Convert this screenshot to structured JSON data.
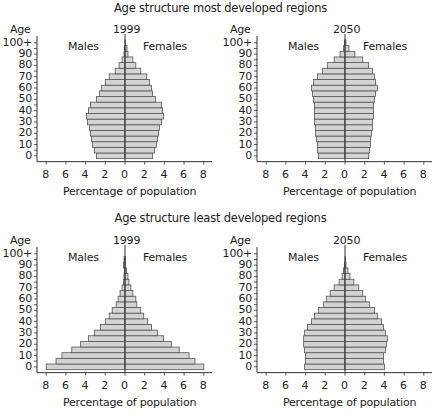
{
  "sections": [
    {
      "title": "Age structure most developed regions"
    },
    {
      "title": "Age structure least developed regions"
    }
  ],
  "common": {
    "y_axis_label": "Age",
    "x_axis_label": "Percentage of population",
    "male_label": "Males",
    "female_label": "Females",
    "y_ticks": [
      "0",
      "10",
      "20",
      "30",
      "40",
      "50",
      "60",
      "70",
      "80",
      "90",
      "100+"
    ],
    "x_ticks": [
      "8",
      "6",
      "4",
      "2",
      "0",
      "2",
      "4",
      "6",
      "8"
    ],
    "bar_fill": "#d3d3d3",
    "bar_stroke": "#555555",
    "axis_color": "#333333"
  },
  "chart_data": [
    {
      "type": "bar",
      "subtype": "population-pyramid",
      "title": "Age structure most developed regions — 1999",
      "year": "1999",
      "xlabel": "Percentage of population",
      "ylabel": "Age",
      "xlim": [
        -8,
        8
      ],
      "age_groups": [
        "0-4",
        "5-9",
        "10-14",
        "15-19",
        "20-24",
        "25-29",
        "30-34",
        "35-39",
        "40-44",
        "45-49",
        "50-54",
        "55-59",
        "60-64",
        "65-69",
        "70-74",
        "75-79",
        "80-84",
        "85-89",
        "90-94",
        "95-99",
        "100+"
      ],
      "series": [
        {
          "name": "Males",
          "values": [
            2.9,
            3.1,
            3.3,
            3.4,
            3.5,
            3.6,
            3.8,
            3.9,
            3.7,
            3.5,
            2.9,
            2.6,
            2.4,
            2.0,
            1.6,
            1.0,
            0.6,
            0.3,
            0.1,
            0.05,
            0.0
          ]
        },
        {
          "name": "Females",
          "values": [
            2.8,
            3.0,
            3.2,
            3.3,
            3.4,
            3.5,
            3.7,
            3.9,
            3.8,
            3.7,
            3.1,
            2.8,
            2.7,
            2.5,
            2.2,
            1.6,
            1.1,
            0.8,
            0.3,
            0.2,
            0.05
          ]
        }
      ]
    },
    {
      "type": "bar",
      "subtype": "population-pyramid",
      "title": "Age structure most developed regions — 2050",
      "year": "2050",
      "xlabel": "Percentage of population",
      "ylabel": "Age",
      "xlim": [
        -8,
        8
      ],
      "age_groups": [
        "0-4",
        "5-9",
        "10-14",
        "15-19",
        "20-24",
        "25-29",
        "30-34",
        "35-39",
        "40-44",
        "45-49",
        "50-54",
        "55-59",
        "60-64",
        "65-69",
        "70-74",
        "75-79",
        "80-84",
        "85-89",
        "90-94",
        "95-99",
        "100+"
      ],
      "series": [
        {
          "name": "Males",
          "values": [
            2.7,
            2.8,
            2.8,
            2.9,
            3.0,
            3.0,
            3.1,
            3.1,
            3.1,
            3.1,
            3.2,
            3.3,
            3.4,
            3.2,
            2.8,
            2.3,
            1.8,
            1.1,
            0.5,
            0.15,
            0.05
          ]
        },
        {
          "name": "Females",
          "values": [
            2.4,
            2.5,
            2.6,
            2.6,
            2.7,
            2.8,
            2.8,
            2.9,
            2.9,
            2.9,
            3.0,
            3.1,
            3.3,
            3.1,
            3.0,
            2.8,
            2.4,
            1.8,
            1.0,
            0.4,
            0.1
          ]
        }
      ]
    },
    {
      "type": "bar",
      "subtype": "population-pyramid",
      "title": "Age structure least developed regions — 1999",
      "year": "1999",
      "xlabel": "Percentage of population",
      "ylabel": "Age",
      "xlim": [
        -8,
        8
      ],
      "age_groups": [
        "0-4",
        "5-9",
        "10-14",
        "15-19",
        "20-24",
        "25-29",
        "30-34",
        "35-39",
        "40-44",
        "45-49",
        "50-54",
        "55-59",
        "60-64",
        "65-69",
        "70-74",
        "75-79",
        "80-84",
        "85-89",
        "90-94",
        "95-99",
        "100+"
      ],
      "series": [
        {
          "name": "Males",
          "values": [
            8.0,
            7.0,
            6.4,
            5.4,
            4.5,
            3.7,
            3.1,
            2.5,
            2.0,
            1.6,
            1.3,
            0.9,
            0.7,
            0.5,
            0.3,
            0.15,
            0.1,
            0.05,
            0.15,
            0.1,
            0.0
          ]
        },
        {
          "name": "Females",
          "values": [
            8.0,
            7.1,
            6.5,
            5.5,
            4.7,
            3.9,
            3.3,
            2.7,
            2.3,
            1.9,
            1.6,
            1.2,
            1.1,
            0.8,
            0.6,
            0.4,
            0.3,
            0.15,
            0.05,
            0.05,
            0.0
          ]
        }
      ]
    },
    {
      "type": "bar",
      "subtype": "population-pyramid",
      "title": "Age structure least developed regions — 2050",
      "year": "2050",
      "xlabel": "Percentage of population",
      "ylabel": "Age",
      "xlim": [
        -8,
        8
      ],
      "age_groups": [
        "0-4",
        "5-9",
        "10-14",
        "15-19",
        "20-24",
        "25-29",
        "30-34",
        "35-39",
        "40-44",
        "45-49",
        "50-54",
        "55-59",
        "60-64",
        "65-69",
        "70-74",
        "75-79",
        "80-84",
        "85-89",
        "90-94",
        "95-99",
        "100+"
      ],
      "series": [
        {
          "name": "Males",
          "values": [
            4.1,
            4.0,
            4.0,
            4.1,
            4.2,
            4.2,
            4.1,
            3.8,
            3.4,
            3.1,
            2.7,
            2.2,
            1.9,
            1.5,
            1.1,
            0.6,
            0.3,
            0.15,
            0.05,
            0.0,
            0.0
          ]
        },
        {
          "name": "Females",
          "values": [
            4.0,
            3.9,
            3.9,
            4.1,
            4.2,
            4.3,
            4.1,
            3.9,
            3.7,
            3.3,
            3.0,
            2.5,
            2.1,
            1.8,
            1.4,
            0.9,
            0.5,
            0.3,
            0.1,
            0.05,
            0.0
          ]
        }
      ]
    }
  ]
}
